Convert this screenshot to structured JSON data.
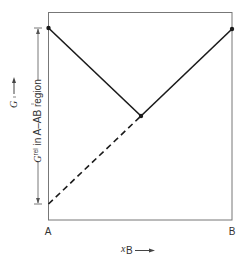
{
  "diagram": {
    "type": "free-energy-composition",
    "colors": {
      "line": "#1a1a1a",
      "frame": "#777777",
      "text": "#333333"
    },
    "x_axis": {
      "left_label": "A",
      "right_label": "B",
      "variable": "x",
      "variable_sub": "B",
      "arrow": "⟶"
    },
    "y_axis": {
      "variable": "G",
      "arrow": "⟶",
      "dimension_label_symbol": "G",
      "dimension_label_sup": "rel",
      "dimension_label_text": " in A–AB region"
    },
    "points": [
      {
        "name": "A-pure",
        "x": 0.0,
        "y": 0.92
      },
      {
        "name": "AB-compound",
        "x": 0.5,
        "y": 0.5
      },
      {
        "name": "B-pure",
        "x": 1.0,
        "y": 0.92
      },
      {
        "name": "A-extrapolated",
        "x": 0.0,
        "y": 0.08
      }
    ],
    "segments": [
      {
        "from": "A-pure",
        "to": "AB-compound",
        "style": "solid"
      },
      {
        "from": "AB-compound",
        "to": "B-pure",
        "style": "solid"
      },
      {
        "from": "A-extrapolated",
        "to": "AB-compound",
        "style": "dashed"
      }
    ]
  }
}
